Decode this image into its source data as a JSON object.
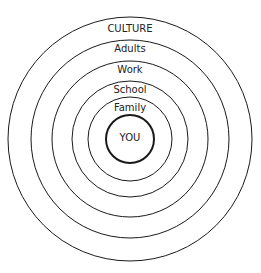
{
  "diagram": {
    "title": "",
    "center": {
      "x": 130,
      "y": 139
    },
    "stroke_color": "#1a1a1a",
    "rings": [
      {
        "label": "CULTURE",
        "r": 122,
        "label_y": 28
      },
      {
        "label": "Adults",
        "r": 99,
        "label_y": 51
      },
      {
        "label": "Work",
        "r": 78,
        "label_y": 73
      },
      {
        "label": "School",
        "r": 58,
        "label_y": 93
      },
      {
        "label": "Family",
        "r": 42,
        "label_y": 111
      },
      {
        "label": "YOU",
        "r": 24,
        "label_y": 142
      }
    ]
  }
}
